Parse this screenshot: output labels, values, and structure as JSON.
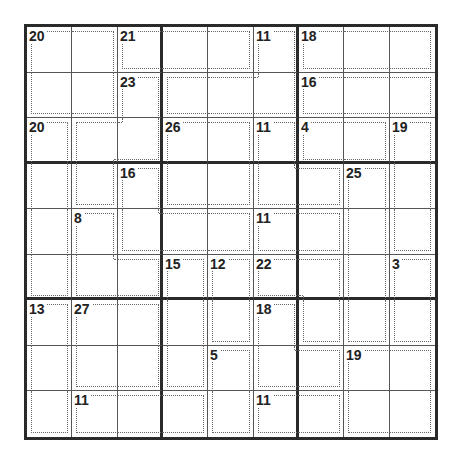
{
  "puzzle": {
    "type": "Killer Sudoku",
    "size": 9,
    "cages": [
      {
        "sum": "20",
        "cells": [
          [
            1,
            1
          ],
          [
            1,
            2
          ],
          [
            2,
            1
          ],
          [
            2,
            2
          ]
        ]
      },
      {
        "sum": "21",
        "cells": [
          [
            1,
            3
          ],
          [
            1,
            4
          ],
          [
            1,
            5
          ]
        ]
      },
      {
        "sum": "11",
        "cells": [
          [
            1,
            6
          ],
          [
            2,
            4
          ],
          [
            2,
            5
          ],
          [
            2,
            6
          ]
        ]
      },
      {
        "sum": "18",
        "cells": [
          [
            1,
            7
          ],
          [
            1,
            8
          ],
          [
            1,
            9
          ]
        ]
      },
      {
        "sum": "23",
        "cells": [
          [
            2,
            3
          ],
          [
            3,
            2
          ],
          [
            3,
            3
          ],
          [
            4,
            2
          ]
        ]
      },
      {
        "sum": "16",
        "cells": [
          [
            2,
            7
          ],
          [
            2,
            8
          ],
          [
            2,
            9
          ]
        ]
      },
      {
        "sum": "20",
        "cells": [
          [
            3,
            1
          ],
          [
            4,
            1
          ],
          [
            5,
            1
          ],
          [
            6,
            1
          ]
        ]
      },
      {
        "sum": "26",
        "cells": [
          [
            3,
            4
          ],
          [
            3,
            5
          ],
          [
            4,
            4
          ],
          [
            4,
            5
          ]
        ]
      },
      {
        "sum": "11",
        "cells": [
          [
            3,
            6
          ],
          [
            4,
            6
          ],
          [
            4,
            7
          ]
        ]
      },
      {
        "sum": "4",
        "cells": [
          [
            3,
            7
          ],
          [
            3,
            8
          ]
        ]
      },
      {
        "sum": "19",
        "cells": [
          [
            3,
            9
          ],
          [
            4,
            9
          ],
          [
            5,
            9
          ]
        ]
      },
      {
        "sum": "16",
        "cells": [
          [
            4,
            3
          ],
          [
            5,
            3
          ],
          [
            5,
            4
          ],
          [
            5,
            5
          ]
        ]
      },
      {
        "sum": "25",
        "cells": [
          [
            4,
            8
          ],
          [
            5,
            8
          ],
          [
            6,
            8
          ],
          [
            7,
            8
          ]
        ]
      },
      {
        "sum": "8",
        "cells": [
          [
            5,
            2
          ],
          [
            6,
            2
          ],
          [
            6,
            3
          ]
        ]
      },
      {
        "sum": "11",
        "cells": [
          [
            5,
            6
          ],
          [
            5,
            7
          ]
        ]
      },
      {
        "sum": "15",
        "cells": [
          [
            6,
            4
          ],
          [
            7,
            4
          ],
          [
            8,
            4
          ]
        ]
      },
      {
        "sum": "12",
        "cells": [
          [
            6,
            5
          ],
          [
            7,
            5
          ]
        ]
      },
      {
        "sum": "22",
        "cells": [
          [
            6,
            6
          ],
          [
            6,
            7
          ],
          [
            7,
            7
          ]
        ]
      },
      {
        "sum": "3",
        "cells": [
          [
            6,
            9
          ],
          [
            7,
            9
          ]
        ]
      },
      {
        "sum": "13",
        "cells": [
          [
            7,
            1
          ],
          [
            8,
            1
          ],
          [
            9,
            1
          ]
        ]
      },
      {
        "sum": "27",
        "cells": [
          [
            7,
            2
          ],
          [
            7,
            3
          ],
          [
            8,
            2
          ],
          [
            8,
            3
          ]
        ]
      },
      {
        "sum": "18",
        "cells": [
          [
            7,
            6
          ],
          [
            8,
            6
          ],
          [
            8,
            7
          ]
        ]
      },
      {
        "sum": "5",
        "cells": [
          [
            8,
            5
          ],
          [
            9,
            5
          ]
        ]
      },
      {
        "sum": "19",
        "cells": [
          [
            8,
            8
          ],
          [
            8,
            9
          ],
          [
            9,
            8
          ],
          [
            9,
            9
          ]
        ]
      },
      {
        "sum": "11",
        "cells": [
          [
            9,
            2
          ],
          [
            9,
            3
          ],
          [
            9,
            4
          ]
        ]
      },
      {
        "sum": "11",
        "cells": [
          [
            9,
            6
          ],
          [
            9,
            7
          ]
        ]
      }
    ],
    "values": []
  }
}
